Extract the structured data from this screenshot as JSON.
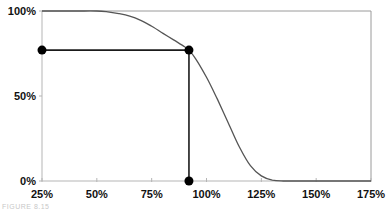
{
  "chart_data": {
    "type": "line",
    "title": "",
    "xlabel": "",
    "ylabel": "",
    "xlim": [
      0.25,
      1.75
    ],
    "ylim": [
      0,
      1
    ],
    "grid": false,
    "legend": null,
    "x_ticks": [
      "25%",
      "50%",
      "75%",
      "100%",
      "125%",
      "150%",
      "175%"
    ],
    "y_ticks": [
      "0%",
      "50%",
      "100%"
    ],
    "series": [
      {
        "name": "curve",
        "x": [
          0.25,
          0.4,
          0.5,
          0.55,
          0.6,
          0.65,
          0.7,
          0.75,
          0.8,
          0.85,
          0.9,
          0.92,
          0.95,
          1.0,
          1.05,
          1.1,
          1.15,
          1.2,
          1.25,
          1.3,
          1.35,
          1.5,
          1.75
        ],
        "y": [
          1.0,
          1.0,
          1.0,
          0.995,
          0.985,
          0.97,
          0.945,
          0.91,
          0.87,
          0.83,
          0.79,
          0.77,
          0.72,
          0.61,
          0.48,
          0.34,
          0.2,
          0.09,
          0.03,
          0.005,
          0.0,
          0.0,
          0.0
        ]
      }
    ],
    "annotations": [
      {
        "type": "point",
        "x": 0.25,
        "y": 0.77,
        "label": "left marker"
      },
      {
        "type": "point",
        "x": 0.92,
        "y": 0.77,
        "label": "curve marker"
      },
      {
        "type": "point",
        "x": 0.92,
        "y": 0.0,
        "label": "bottom marker"
      },
      {
        "type": "hline",
        "y": 0.77,
        "x_from": 0.25,
        "x_to": 0.92
      },
      {
        "type": "vline",
        "x": 0.92,
        "y_from": 0.0,
        "y_to": 0.77
      }
    ],
    "colors": {
      "curve": "#555555",
      "frame": "#9a9a9a",
      "marker": "#000000",
      "guide": "#1a1a1a"
    }
  },
  "caption": "FIGURE 8.15"
}
